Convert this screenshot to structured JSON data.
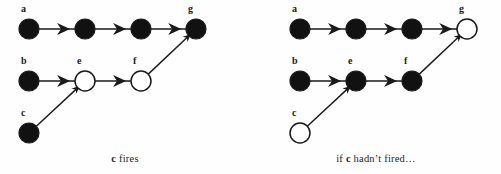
{
  "figure": {
    "background_color": "#fefefe",
    "stroke_color": "#1a1a1a",
    "node_fill_active": "#111111",
    "node_fill_inactive": "#ffffff",
    "node_radius": 10
  },
  "panels": [
    {
      "id": "left",
      "caption_prefix": "",
      "caption_node": "c",
      "caption_suffix": " fires",
      "caption_text": "c fires",
      "nodes": [
        {
          "id": "a",
          "label": "a",
          "x": 29,
          "y": 29,
          "state": "filled"
        },
        {
          "id": "a2",
          "label": "",
          "x": 85,
          "y": 29,
          "state": "filled"
        },
        {
          "id": "a3",
          "label": "",
          "x": 141,
          "y": 29,
          "state": "filled"
        },
        {
          "id": "g",
          "label": "g",
          "x": 196,
          "y": 29,
          "state": "filled"
        },
        {
          "id": "b",
          "label": "b",
          "x": 29,
          "y": 81,
          "state": "filled"
        },
        {
          "id": "e",
          "label": "e",
          "x": 85,
          "y": 81,
          "state": "open"
        },
        {
          "id": "f",
          "label": "f",
          "x": 141,
          "y": 81,
          "state": "open"
        },
        {
          "id": "c",
          "label": "c",
          "x": 29,
          "y": 133,
          "state": "filled"
        }
      ],
      "edges": [
        {
          "from": "a",
          "to": "a2",
          "arrow": "mid"
        },
        {
          "from": "a2",
          "to": "a3",
          "arrow": "mid"
        },
        {
          "from": "a3",
          "to": "g",
          "arrow": "mid"
        },
        {
          "from": "b",
          "to": "e",
          "arrow": "mid"
        },
        {
          "from": "e",
          "to": "f",
          "arrow": "mid"
        },
        {
          "from": "c",
          "to": "e",
          "arrow": "tip"
        },
        {
          "from": "f",
          "to": "g",
          "arrow": "tip"
        }
      ]
    },
    {
      "id": "right",
      "caption_prefix": "if ",
      "caption_node": "c",
      "caption_suffix": " hadn’t fired…",
      "caption_text": "if c hadn’t fired…",
      "nodes": [
        {
          "id": "a",
          "label": "a",
          "x": 49,
          "y": 29,
          "state": "filled"
        },
        {
          "id": "a2",
          "label": "",
          "x": 105,
          "y": 29,
          "state": "filled"
        },
        {
          "id": "a3",
          "label": "",
          "x": 161,
          "y": 29,
          "state": "filled"
        },
        {
          "id": "g",
          "label": "g",
          "x": 216,
          "y": 29,
          "state": "open"
        },
        {
          "id": "b",
          "label": "b",
          "x": 49,
          "y": 81,
          "state": "filled"
        },
        {
          "id": "e",
          "label": "e",
          "x": 105,
          "y": 81,
          "state": "filled"
        },
        {
          "id": "f",
          "label": "f",
          "x": 161,
          "y": 81,
          "state": "filled"
        },
        {
          "id": "c",
          "label": "c",
          "x": 49,
          "y": 133,
          "state": "open"
        }
      ],
      "edges": [
        {
          "from": "a",
          "to": "a2",
          "arrow": "mid"
        },
        {
          "from": "a2",
          "to": "a3",
          "arrow": "mid"
        },
        {
          "from": "a3",
          "to": "g",
          "arrow": "mid"
        },
        {
          "from": "b",
          "to": "e",
          "arrow": "mid"
        },
        {
          "from": "e",
          "to": "f",
          "arrow": "mid"
        },
        {
          "from": "c",
          "to": "e",
          "arrow": "tip"
        },
        {
          "from": "f",
          "to": "g",
          "arrow": "tip"
        }
      ]
    }
  ]
}
